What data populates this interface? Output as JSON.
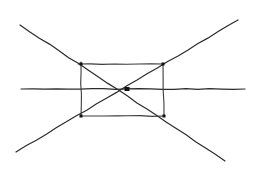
{
  "diagram": {
    "type": "perspective-sketch",
    "canvas": {
      "width": 262,
      "height": 173,
      "background": "#ffffff"
    },
    "colors": {
      "stroke": "#2b2b2b",
      "node": "#111111"
    },
    "rectangle": {
      "top_left": [
        81,
        64
      ],
      "top_right": [
        163,
        64
      ],
      "bottom_right": [
        164,
        116
      ],
      "bottom_left": [
        81,
        116
      ]
    },
    "center_point": [
      127,
      89
    ],
    "lines": [
      {
        "name": "diagonal-descending",
        "from": [
          20,
          25
        ],
        "to": [
          225,
          161
        ]
      },
      {
        "name": "diagonal-ascending",
        "from": [
          16,
          152
        ],
        "to": [
          238,
          20
        ]
      },
      {
        "name": "horizon-line",
        "from": [
          21,
          89
        ],
        "to": [
          245,
          89
        ]
      }
    ],
    "corner_marks": [
      [
        81,
        64
      ],
      [
        163,
        64
      ],
      [
        164,
        116
      ],
      [
        81,
        116
      ]
    ]
  }
}
